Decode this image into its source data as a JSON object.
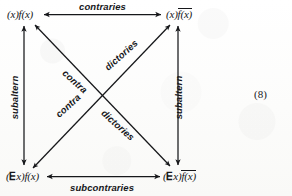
{
  "figure": {
    "equation_number": "(8)",
    "ink_color": "#16171a",
    "paper_color": "#fdfdfc"
  },
  "corners": {
    "top_left": {
      "name": "universal-affirmative",
      "quantifier": "(x)",
      "predicate": "f(x)",
      "negated": false,
      "full_text": "(x)f(x)"
    },
    "top_right": {
      "name": "universal-negative",
      "quantifier": "(x)",
      "predicate": "f(x)",
      "negated": true,
      "full_text": "(x)f(x)̅"
    },
    "bottom_left": {
      "name": "particular-affirmative",
      "quantifier": "(∃x)",
      "quantifier_symbol": "∃",
      "predicate": "f(x)",
      "negated": false,
      "full_text": "(∃x)f(x)"
    },
    "bottom_right": {
      "name": "particular-negative",
      "quantifier": "(∃x)",
      "quantifier_symbol": "∃",
      "predicate": "f(x)",
      "negated": true,
      "full_text": "(∃x)f(x)̅"
    }
  },
  "relations": {
    "top_edge": "contraries",
    "bottom_edge": "subcontraries",
    "left_edge": "subaltern",
    "right_edge": "subaltern",
    "diagonal_upper_left_word": "contra",
    "diagonal_upper_right_word": "dictories",
    "diagonal_lower_left_word": "contra",
    "diagonal_lower_right_word": "dictories"
  },
  "arrows": {
    "top": "double-headed-horizontal",
    "bottom": "double-headed-horizontal",
    "left": "double-headed-vertical",
    "right": "double-headed-vertical",
    "diagonal_a": "double-headed-diagonal",
    "diagonal_b": "double-headed-diagonal"
  }
}
